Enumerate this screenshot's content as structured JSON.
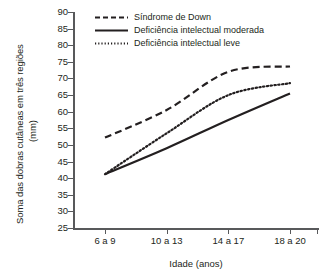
{
  "chart_data": {
    "type": "line",
    "title": "",
    "xlabel": "Idade (anos)",
    "ylabel": "Soma das dobras cutâneas em três regiões",
    "ylabel_unit": "(mm)",
    "categories": [
      "6 a 9",
      "10 a 13",
      "14 a 17",
      "18 a 20"
    ],
    "ylim": [
      25,
      90
    ],
    "yticks": [
      25,
      30,
      35,
      40,
      45,
      50,
      55,
      60,
      65,
      70,
      75,
      80,
      85,
      90
    ],
    "grid": false,
    "legend_position": "top-left",
    "series": [
      {
        "name": "Síndrome de Down",
        "style": "dashed",
        "color": "#231f20",
        "values": [
          52.2,
          60.5,
          72.0,
          73.6
        ],
        "control_points": [
          {
            "x": "6 a 9",
            "y": 52.2
          },
          {
            "x": "10 a 13",
            "y": 60.5
          },
          {
            "x": "14 a 17",
            "y": 72.0
          },
          {
            "x": "18 a 20",
            "y": 73.6
          }
        ]
      },
      {
        "name": "Deficiência intelectual moderada",
        "style": "solid",
        "color": "#231f20",
        "values": [
          41.2,
          49.0,
          57.5,
          65.5
        ],
        "control_points": [
          {
            "x": "6 a 9",
            "y": 41.2
          },
          {
            "x": "10 a 13",
            "y": 49.0
          },
          {
            "x": "14 a 17",
            "y": 57.5
          },
          {
            "x": "18 a 20",
            "y": 65.5
          }
        ]
      },
      {
        "name": "Deficiência intelectual leve",
        "style": "dotted",
        "color": "#231f20",
        "values": [
          41.2,
          53.5,
          65.0,
          68.6
        ],
        "control_points": [
          {
            "x": "6 a 9",
            "y": 41.2
          },
          {
            "x": "10 a 13",
            "y": 53.5
          },
          {
            "x": "14 a 17",
            "y": 65.0
          },
          {
            "x": "18 a 20",
            "y": 68.6
          }
        ]
      }
    ]
  },
  "axis": {
    "y_tick_labels": [
      "90",
      "85",
      "80",
      "75",
      "70",
      "65",
      "60",
      "55",
      "50",
      "45",
      "40",
      "35",
      "30",
      "25"
    ],
    "x_tick_labels": [
      "6 a 9",
      "10 a 13",
      "14 a 17",
      "18 a 20"
    ],
    "x_title": "Idade (anos)",
    "y_title_line1": "Soma das dobras cutâneas em três regiões",
    "y_title_line2": "(mm)"
  },
  "legend": {
    "items": [
      {
        "label": "Síndrome de Down",
        "style": "dashed"
      },
      {
        "label": "Deficiência intelectual moderada",
        "style": "solid"
      },
      {
        "label": "Deficiência intelectual leve",
        "style": "dotted"
      }
    ]
  },
  "colors": {
    "ink": "#231f20",
    "axis": "#58595b",
    "background": "#ffffff"
  }
}
